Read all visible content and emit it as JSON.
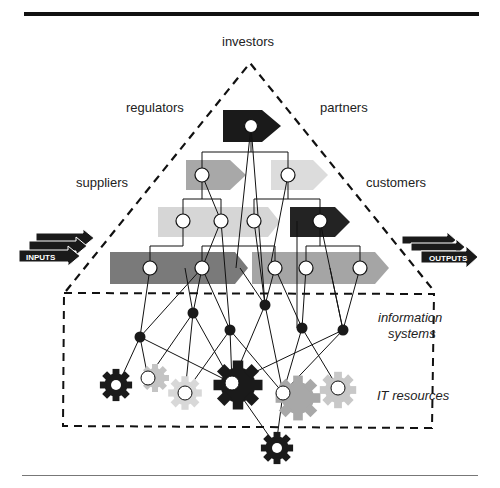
{
  "diagram": {
    "top_rule": true,
    "bottom_rule": true,
    "stakeholders": {
      "top": "investors",
      "upper_left": "regulators",
      "upper_right": "partners",
      "left": "suppliers",
      "right": "customers"
    },
    "flow": {
      "inputs_label": "INPUTS",
      "outputs_label": "OUTPUTS"
    },
    "layers": {
      "information_systems_line1": "information",
      "information_systems_line2": "systems",
      "it_resources": "IT resources"
    },
    "colors": {
      "black": "#1a1a1a",
      "dark_gray": "#777777",
      "mid_gray": "#aaaaaa",
      "light_gray": "#d4d4d4",
      "gear_gray": "#b5b5b5"
    }
  }
}
